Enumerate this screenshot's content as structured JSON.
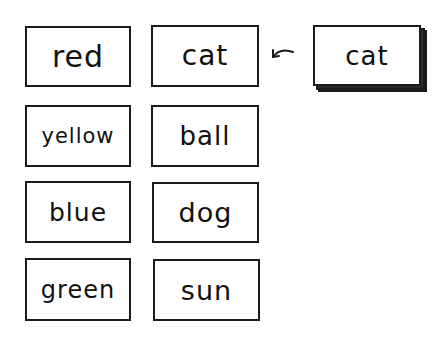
{
  "diagram": {
    "type": "word-card-grid",
    "colors": {
      "ink": "#1a1a1a",
      "background": "#ffffff"
    },
    "grid": {
      "columns": [
        {
          "name": "colors",
          "cards": [
            {
              "label": "red"
            },
            {
              "label": "yellow"
            },
            {
              "label": "blue"
            },
            {
              "label": "green"
            }
          ]
        },
        {
          "name": "nouns",
          "cards": [
            {
              "label": "cat"
            },
            {
              "label": "ball"
            },
            {
              "label": "dog"
            },
            {
              "label": "sun"
            }
          ]
        }
      ]
    },
    "deck": {
      "top_card_label": "cat",
      "stacked": true
    },
    "arrow": {
      "direction": "left",
      "from": "deck",
      "to": "nouns-card-1",
      "icon": "curved-arrow-left-icon"
    }
  }
}
